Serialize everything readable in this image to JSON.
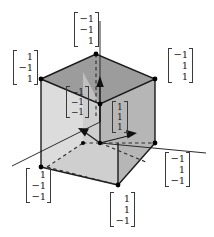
{
  "figure": {
    "background_color": "#ffffff",
    "colors": {
      "edge": "#1a1a1a",
      "vertex_dot": "#000000",
      "top_face": "#9a9a9a",
      "right_face": "#b4b4b4",
      "left_face": "#d8d8d8",
      "floor_face": "#cfcfcf",
      "bracket": "#3a3a3a",
      "axis": "#2b2b2b",
      "dashed": "#2b2b2b"
    },
    "projection": "oblique-cabinet"
  },
  "vectors": [
    {
      "id": "top-back",
      "name": "vector-neg1-neg1-pos1",
      "entries": [
        "−1",
        "−1",
        "1"
      ],
      "position": "top-center",
      "vertex": "back-top"
    },
    {
      "id": "left-top",
      "name": "vector-pos1-neg1-pos1",
      "entries": [
        "1",
        "−1",
        "1"
      ],
      "position": "upper-left",
      "vertex": "front-left-top"
    },
    {
      "id": "right-top",
      "name": "vector-neg1-pos1-pos1",
      "entries": [
        "−1",
        "1",
        "1"
      ],
      "position": "upper-right",
      "vertex": "back-right-top"
    },
    {
      "id": "inner-left",
      "name": "vector-neg1-neg1-neg1",
      "entries": [
        "−1",
        "−1",
        "−1"
      ],
      "position": "interior-left",
      "vertex": "center-left-arrow"
    },
    {
      "id": "inner-right",
      "name": "vector-pos1-pos1-pos1",
      "entries": [
        "1",
        "1",
        "1"
      ],
      "position": "interior-right",
      "vertex": "center-right-arrow"
    },
    {
      "id": "bottom-left",
      "name": "vector-pos1-neg1-neg1",
      "entries": [
        "1",
        "−1",
        "−1"
      ],
      "position": "lower-left",
      "vertex": "front-left-bottom"
    },
    {
      "id": "bottom-center",
      "name": "vector-pos1-pos1-neg1",
      "entries": [
        "1",
        "1",
        "−1"
      ],
      "position": "bottom-center",
      "vertex": "front-bottom"
    },
    {
      "id": "bottom-right",
      "name": "vector-neg1-pos1-neg1",
      "entries": [
        "−1",
        "1",
        "−1"
      ],
      "position": "lower-right",
      "vertex": "right-bottom"
    }
  ],
  "axes": {
    "count": 3,
    "vertical_arrow": "up",
    "interior_arrows": [
      "left",
      "right"
    ],
    "solid_extensions": [
      "lower-left",
      "right"
    ]
  }
}
